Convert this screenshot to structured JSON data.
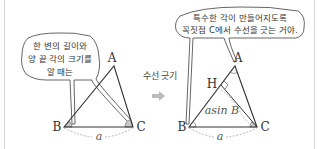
{
  "left_panel": {
    "bubble_lines": [
      "한 변의 길이와",
      "양 끝 각의 크기를",
      "알 때는"
    ],
    "vertices": {
      "A": "A",
      "B": "B",
      "C": "C"
    },
    "side_label": "a"
  },
  "transition": {
    "label": "수선 긋기",
    "arrow": "➡"
  },
  "right_panel": {
    "bubble_lines": [
      "특수한 각이 만들어지도록",
      "꼭짓점 C에서 수선을 긋는 거야."
    ],
    "vertices": {
      "A": "A",
      "B": "B",
      "C": "C",
      "H": "H"
    },
    "side_label": "a",
    "altitude_label": "asin B"
  },
  "colors": {
    "line": "#333333",
    "angle_fill": "#c8c8c8",
    "dashed": "#999999",
    "arrow": "#bbbbbb"
  }
}
